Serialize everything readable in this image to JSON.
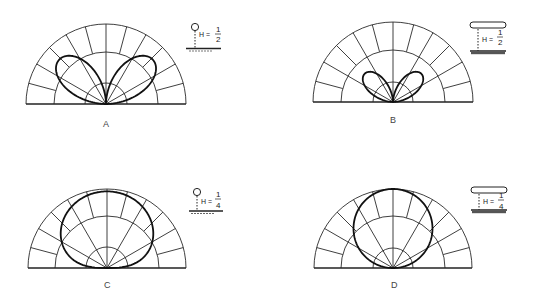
{
  "figure": {
    "panels": [
      {
        "id": "A",
        "label": "A",
        "antenna": "vertical-dipole",
        "height_text": "H =",
        "height_num": "1",
        "height_den": "2",
        "pattern": "two-high-angle-lobes-large",
        "center": [
          106,
          104
        ],
        "radii": [
          21,
          52,
          80
        ]
      },
      {
        "id": "B",
        "label": "B",
        "antenna": "horizontal-dipole",
        "height_text": "H =",
        "height_num": "1",
        "height_den": "2",
        "pattern": "two-small-lobes",
        "center": [
          393,
          102
        ],
        "radii": [
          20,
          52,
          80
        ]
      },
      {
        "id": "C",
        "label": "C",
        "antenna": "vertical-dipole",
        "height_text": "H =",
        "height_num": "1",
        "height_den": "4",
        "pattern": "single-broad-vertical-lobe",
        "center": [
          107,
          268
        ],
        "radii": [
          21,
          52,
          79
        ]
      },
      {
        "id": "D",
        "label": "D",
        "antenna": "horizontal-dipole",
        "height_text": "H =",
        "height_num": "1",
        "height_den": "4",
        "pattern": "single-circular-vertical-lobe",
        "center": [
          393,
          268
        ],
        "radii": [
          20,
          52,
          79
        ]
      }
    ],
    "grid": {
      "spoke_angles_deg": [
        0,
        15,
        30,
        45,
        60,
        75,
        90,
        105,
        120,
        135,
        150,
        165,
        180
      ]
    }
  }
}
